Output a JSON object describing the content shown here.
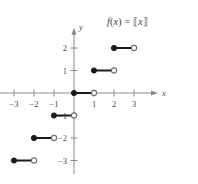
{
  "figure": {
    "label": "greatest-integer-step-function-graph",
    "formula_text": "f(x) = [[x]]",
    "formula_parts": {
      "fn": "f",
      "paren_open": "(",
      "var": "x",
      "paren_close": ")",
      "equals": "=",
      "bracket_open": "⟦",
      "bracket_var": "x",
      "bracket_close": "⟧"
    }
  },
  "axes": {
    "x_label": "x",
    "y_label": "y",
    "x_ticks": [
      {
        "value": -3,
        "label": "−3"
      },
      {
        "value": -2,
        "label": "−2"
      },
      {
        "value": -1,
        "label": "−1"
      },
      {
        "value": 1,
        "label": "1"
      },
      {
        "value": 2,
        "label": "2"
      },
      {
        "value": 3,
        "label": "3"
      }
    ],
    "y_ticks": [
      {
        "value": 2,
        "label": "2"
      },
      {
        "value": 1,
        "label": "1"
      },
      {
        "value": -1,
        "label": "−1"
      },
      {
        "value": -2,
        "label": "−2"
      },
      {
        "value": -3,
        "label": "−3"
      }
    ],
    "xlim": [
      -3.8,
      4.2
    ],
    "ylim": [
      -3.6,
      2.9
    ],
    "grid": false,
    "axis_color": "#8a8a8a",
    "curve_color": "#1a1a1a"
  },
  "chart_data": {
    "type": "line",
    "xlabel": "x",
    "ylabel": "y",
    "xlim": [
      -3.8,
      4.2
    ],
    "ylim": [
      -3.6,
      2.9
    ],
    "grid": false,
    "legend": null,
    "function": "greatest integer / floor function",
    "segments": [
      {
        "y": -3,
        "x_start": -3,
        "x_end": -2,
        "start_closed": true,
        "end_closed": false
      },
      {
        "y": -2,
        "x_start": -2,
        "x_end": -1,
        "start_closed": true,
        "end_closed": false
      },
      {
        "y": -1,
        "x_start": -1,
        "x_end": 0,
        "start_closed": true,
        "end_closed": false
      },
      {
        "y": 0,
        "x_start": 0,
        "x_end": 1,
        "start_closed": true,
        "end_closed": false
      },
      {
        "y": 1,
        "x_start": 1,
        "x_end": 2,
        "start_closed": true,
        "end_closed": false
      },
      {
        "y": 2,
        "x_start": 2,
        "x_end": 3,
        "start_closed": true,
        "end_closed": false
      }
    ],
    "x_ticks": [
      -3,
      -2,
      -1,
      1,
      2,
      3
    ],
    "y_ticks": [
      2,
      1,
      -1,
      -2,
      -3
    ]
  }
}
